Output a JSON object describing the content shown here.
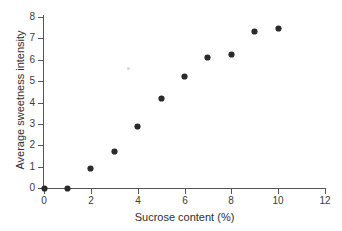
{
  "chart_data": {
    "type": "scatter",
    "title": "",
    "xlabel": "Sucrose content (%)",
    "ylabel": "Average sweetness intensity",
    "xlim": [
      0,
      12
    ],
    "ylim": [
      0,
      8
    ],
    "xticks": [
      0,
      2,
      4,
      6,
      8,
      10,
      12
    ],
    "yticks": [
      0,
      1,
      2,
      3,
      4,
      5,
      6,
      7,
      8
    ],
    "grid": false,
    "legend": null,
    "marker_color": "#2b2b2b",
    "axis_color": "#555555",
    "series": [
      {
        "name": "Average sweetness intensity",
        "x": [
          0,
          1,
          2,
          3,
          4,
          5,
          6,
          7,
          8,
          9,
          10
        ],
        "y": [
          0,
          0,
          0.9,
          1.7,
          2.9,
          4.2,
          5.2,
          6.1,
          6.25,
          7.3,
          7.45
        ]
      },
      {
        "name": "faint-artifact",
        "x": [
          3.6
        ],
        "y": [
          5.6
        ]
      }
    ]
  },
  "axis": {
    "x_tick_labels": [
      "0",
      "2",
      "4",
      "6",
      "8",
      "10",
      "12"
    ],
    "y_tick_labels": [
      "0",
      "1",
      "2",
      "3",
      "4",
      "5",
      "6",
      "7",
      "8"
    ],
    "x_title": "Sucrose content (%)",
    "y_title": "Average sweetness intensity"
  }
}
